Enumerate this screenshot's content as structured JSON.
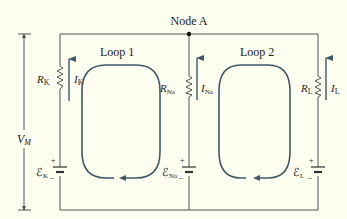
{
  "diagram": {
    "node": {
      "label": "Node A"
    },
    "voltage": {
      "label": "V",
      "subscript": "M"
    },
    "loops": [
      {
        "label": "Loop 1",
        "direction": "clockwise"
      },
      {
        "label": "Loop 2",
        "direction": "clockwise"
      }
    ],
    "branches": [
      {
        "name": "K",
        "resistor": {
          "label": "R",
          "subscript": "K"
        },
        "current": {
          "label": "I",
          "subscript": "K",
          "direction": "up"
        },
        "emf": {
          "label": "ℰ",
          "subscript": "K",
          "plus": "+",
          "minus": "–"
        }
      },
      {
        "name": "Na",
        "resistor": {
          "label": "R",
          "subscript": "Na"
        },
        "current": {
          "label": "I",
          "subscript": "Na",
          "direction": "up"
        },
        "emf": {
          "label": "ℰ",
          "subscript": "Na",
          "plus": "+",
          "minus": "–"
        }
      },
      {
        "name": "L",
        "resistor": {
          "label": "R",
          "subscript": "L"
        },
        "current": {
          "label": "I",
          "subscript": "L",
          "direction": "up"
        },
        "emf": {
          "label": "ℰ",
          "subscript": "L",
          "plus": "+",
          "minus": "–"
        }
      }
    ],
    "colors": {
      "background": "#fdfdf0",
      "wire": "#555555",
      "loop": "#3d5a66",
      "text": "#222222"
    }
  }
}
